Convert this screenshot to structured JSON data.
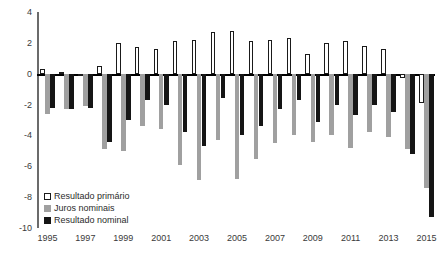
{
  "chart_data": {
    "type": "bar",
    "title": "",
    "xlabel": "",
    "ylabel": "",
    "ylim": [
      -10,
      4
    ],
    "yticks": [
      4,
      2,
      0,
      -2,
      -4,
      -6,
      -8,
      -10
    ],
    "ytick_labels": [
      "4",
      "2",
      "0",
      "-2",
      "-4",
      "-6",
      "-8",
      "-10"
    ],
    "grid": false,
    "legend_position": "bottom-left",
    "categories": [
      "1995",
      "1996",
      "1997",
      "1998",
      "1999",
      "2000",
      "2001",
      "2002",
      "2003",
      "2004",
      "2005",
      "2006",
      "2007",
      "2008",
      "2009",
      "2010",
      "2011",
      "2012",
      "2013",
      "2014",
      "2015"
    ],
    "xtick_labels": [
      "1995",
      "1997",
      "1999",
      "2001",
      "2003",
      "2005",
      "2007",
      "2009",
      "2011",
      "2013",
      "2015"
    ],
    "series": [
      {
        "name": "Resultado primário",
        "color": "#ffffff",
        "values": [
          0.3,
          0.1,
          -0.1,
          0.5,
          2.0,
          1.7,
          1.6,
          2.1,
          2.2,
          2.7,
          2.8,
          2.1,
          2.2,
          2.3,
          1.3,
          2.0,
          2.1,
          1.8,
          1.6,
          -0.3,
          -1.9
        ]
      },
      {
        "name": "Juros nominais",
        "color": "#a0a0a0",
        "values": [
          -2.6,
          -2.3,
          -2.1,
          -4.9,
          -5.0,
          -3.4,
          -3.6,
          -5.9,
          -6.9,
          -4.3,
          -6.8,
          -5.5,
          -4.5,
          -4.0,
          -4.4,
          -4.0,
          -4.8,
          -3.8,
          -4.1,
          -4.9,
          -7.4
        ]
      },
      {
        "name": "Resultado nominal",
        "color": "#151515",
        "values": [
          -2.2,
          -2.3,
          -2.2,
          -4.4,
          -3.0,
          -1.7,
          -2.0,
          -3.8,
          -4.7,
          -1.6,
          -4.0,
          -3.4,
          -2.3,
          -1.7,
          -3.1,
          -2.0,
          -2.7,
          -2.0,
          -2.5,
          -5.2,
          -9.3
        ]
      }
    ]
  },
  "legend": {
    "items": [
      {
        "label": "Resultado primário",
        "key": "primario"
      },
      {
        "label": "Juros nominais",
        "key": "juros"
      },
      {
        "label": "Resultado nominal",
        "key": "nominal"
      }
    ]
  }
}
